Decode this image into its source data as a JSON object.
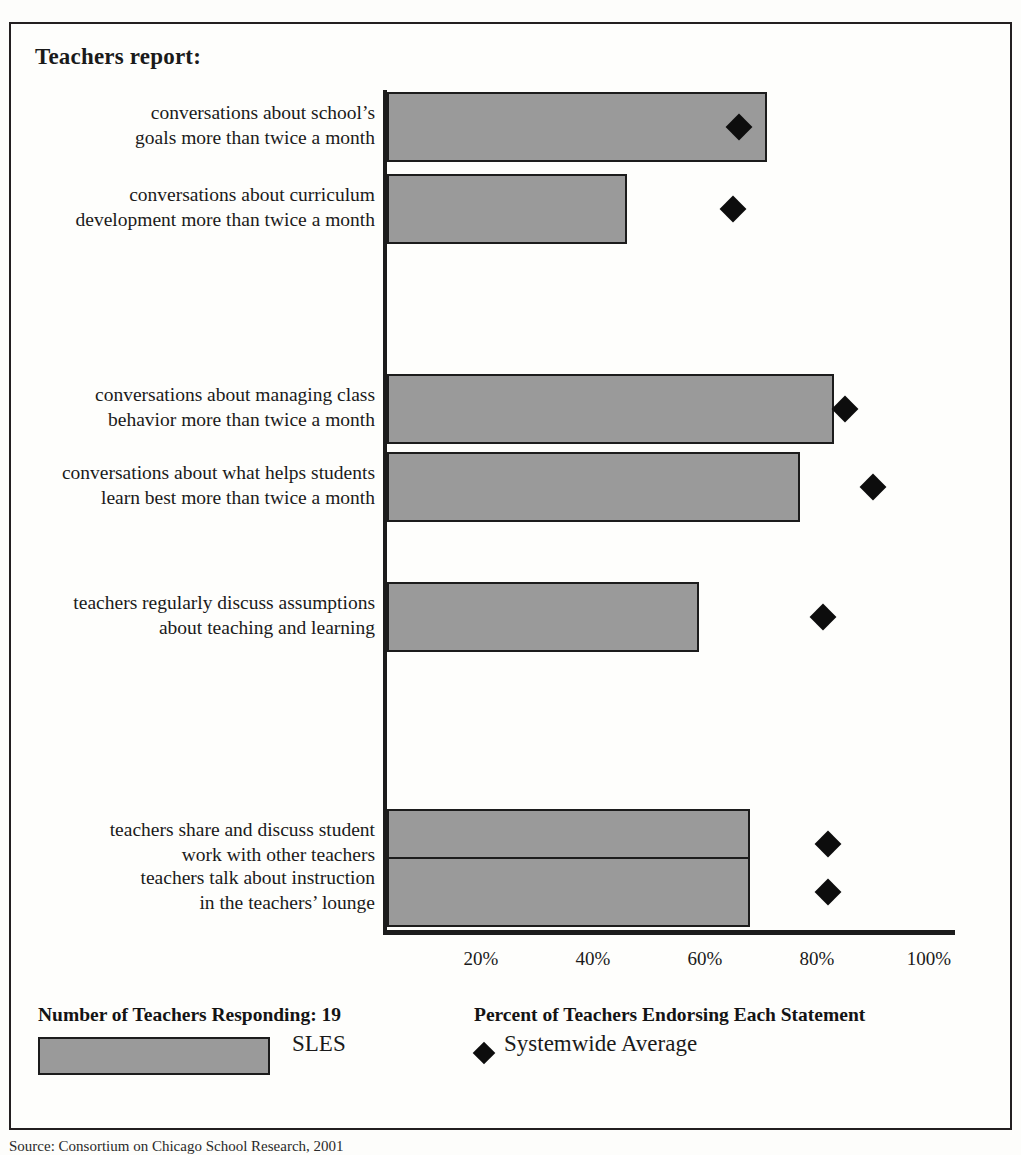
{
  "chart": {
    "title": "Teachers report:",
    "source_note": "Source: Consortium on Chicago School Research, 2001"
  },
  "legend": {
    "respondents_label": "Number of Teachers Responding: 19",
    "axis_caption": "Percent of Teachers Endorsing Each Statement",
    "series_bar_label": "SLES",
    "series_marker_label": "Systemwide Average",
    "bar_color": "#9a9a9a",
    "marker_color": "#0d0d0d"
  },
  "chart_data": {
    "type": "bar",
    "orientation": "horizontal",
    "title": "Teachers report:",
    "xlabel": "Percent of Teachers Endorsing Each Statement",
    "ylabel": "",
    "xlim": [
      0,
      100
    ],
    "grid": false,
    "legend_position": "bottom",
    "tick_labels": [
      "20%",
      "40%",
      "60%",
      "80%",
      "100%"
    ],
    "ticks": [
      20,
      40,
      60,
      80,
      100
    ],
    "categories": [
      "conversations about school's goals more than twice a month",
      "conversations about curriculum development more than twice a month",
      "conversations about managing class behavior more than twice a month",
      "conversations about what helps students learn best more than twice a month",
      "teachers regularly discuss assumptions about teaching and learning",
      "teachers share and discuss student work with other teachers",
      "teachers talk about instruction in the teachers' lounge"
    ],
    "series": [
      {
        "name": "SLES",
        "values": [
          71,
          46,
          83,
          77,
          59,
          68,
          68
        ]
      },
      {
        "name": "Systemwide Average",
        "values": [
          66,
          65,
          85,
          90,
          81,
          82,
          82
        ]
      }
    ]
  },
  "rows": [
    {
      "line1": "conversations about school’s",
      "line2": "goals more than twice a month",
      "bar": 71,
      "marker": 66,
      "top": 90
    },
    {
      "line1": "conversations about curriculum",
      "line2": "development more than twice a month",
      "bar": 46,
      "marker": 65,
      "top": 172
    },
    {
      "line1": "conversations about managing class",
      "line2": "behavior more than twice a month",
      "bar": 83,
      "marker": 85,
      "top": 372
    },
    {
      "line1": "conversations about what helps students",
      "line2": "learn best more than twice a month",
      "bar": 77,
      "marker": 90,
      "top": 450
    },
    {
      "line1": "teachers regularly discuss assumptions",
      "line2": "about teaching and learning",
      "bar": 59,
      "marker": 81,
      "top": 580
    },
    {
      "line1": "teachers share and discuss student",
      "line2": "work with other teachers",
      "bar": 68,
      "marker": 82,
      "top": 807
    },
    {
      "line1": "teachers talk about instruction",
      "line2": "in the teachers’ lounge",
      "bar": 68,
      "marker": 82,
      "top": 855
    }
  ]
}
